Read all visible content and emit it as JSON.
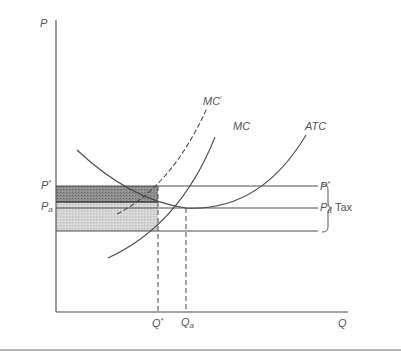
{
  "diagram": {
    "type": "cost-curves-with-tax",
    "axes": {
      "y_label": "P",
      "x_label": "Q"
    },
    "curves": [
      {
        "name": "MC'",
        "label": "MC",
        "prime": "′",
        "style": "dashed"
      },
      {
        "name": "MC",
        "label": "MC",
        "style": "solid"
      },
      {
        "name": "ATC",
        "label": "ATC",
        "style": "solid"
      }
    ],
    "price_levels": {
      "p_star": {
        "base": "P",
        "mark": "*"
      },
      "p_a": {
        "base": "P",
        "sub": "a"
      }
    },
    "quantity_levels": {
      "q_star": {
        "base": "Q",
        "mark": "*"
      },
      "q_a": {
        "base": "Q",
        "sub": "a"
      }
    },
    "brace_label": "Tax",
    "shaded_regions": [
      {
        "name": "dark-band",
        "color": "#8a8a8a"
      },
      {
        "name": "light-band",
        "color": "#d2d2d2"
      }
    ],
    "colors": {
      "line": "#4a4a4a",
      "label": "#555555",
      "dark_fill": "#8a8a8a",
      "light_fill": "#d2d2d2"
    }
  }
}
